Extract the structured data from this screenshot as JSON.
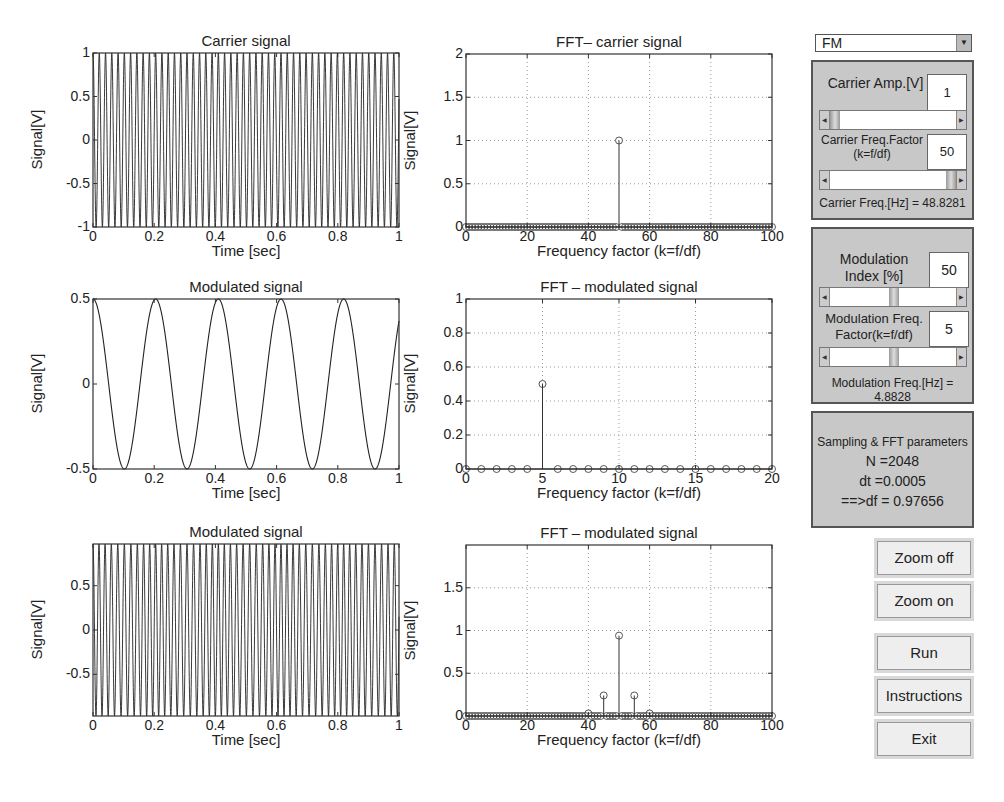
{
  "controls": {
    "modulation_type": {
      "selected": "FM"
    },
    "carrier_panel": {
      "amp_label": "Carrier Amp.[V]",
      "amp_value": "1",
      "freq_factor_label_1": "Carrier Freq.Factor",
      "freq_factor_label_2": "(k=f/df)",
      "freq_factor_value": "50",
      "freq_readout": "Carrier Freq.[Hz] = 48.8281"
    },
    "modulation_panel": {
      "index_label_1": "Modulation",
      "index_label_2": "Index [%]",
      "index_value": "50",
      "freq_factor_label_1": "Modulation Freq.",
      "freq_factor_label_2": "Factor(k=f/df)",
      "freq_factor_value": "5",
      "freq_readout": "Modulation Freq.[Hz] = 4.8828"
    },
    "sampling_panel": {
      "title": "Sampling & FFT parameters",
      "n_line": "N =2048",
      "dt_line": "dt =0.0005",
      "df_line": "==>df = 0.97656"
    },
    "buttons": {
      "zoom_off": "Zoom off",
      "zoom_on": "Zoom on",
      "run": "Run",
      "instructions": "Instructions",
      "exit": "Exit"
    }
  },
  "chart_data": [
    {
      "id": "carrier",
      "type": "line",
      "title": "Carrier signal",
      "xlabel": "Time [sec]",
      "ylabel": "Signal[V]",
      "xlim": [
        0,
        1
      ],
      "ylim": [
        -1,
        1
      ],
      "xticks": [
        "0",
        "0.2",
        "0.4",
        "0.6",
        "0.8",
        "1"
      ],
      "yticks": [
        "-1",
        "-0.5",
        "0",
        "0.5",
        "1"
      ],
      "grid": false,
      "series": [
        {
          "name": "carrier",
          "function": "1*cos(2*pi*48.8281*t)",
          "amplitude": 1,
          "frequency_hz": 48.8281
        }
      ]
    },
    {
      "id": "fft_carrier",
      "type": "stem",
      "title": "FFT– carrier signal",
      "xlabel": "Frequency factor (k=f/df)",
      "ylabel": "Signal[V]",
      "xlim": [
        0,
        100
      ],
      "ylim": [
        0,
        2
      ],
      "xticks": [
        "0",
        "20",
        "40",
        "60",
        "80",
        "100"
      ],
      "yticks": [
        "0",
        "0.5",
        "1",
        "1.5",
        "2"
      ],
      "grid": true,
      "k_range": [
        0,
        100
      ],
      "peaks": [
        {
          "k": 50,
          "value": 1.0
        }
      ]
    },
    {
      "id": "modulating",
      "type": "line",
      "title": "Modulated signal",
      "xlabel": "Time [sec]",
      "ylabel": "Signal[V]",
      "xlim": [
        0,
        1
      ],
      "ylim": [
        -0.5,
        0.5
      ],
      "xticks": [
        "0",
        "0.2",
        "0.4",
        "0.6",
        "0.8",
        "1"
      ],
      "yticks": [
        "-0.5",
        "0",
        "0.5"
      ],
      "grid": false,
      "series": [
        {
          "name": "modulating",
          "function": "0.5*cos(2*pi*4.8828*t)",
          "amplitude": 0.5,
          "frequency_hz": 4.8828
        }
      ]
    },
    {
      "id": "fft_modulating",
      "type": "stem",
      "title": "FFT – modulated signal",
      "xlabel": "Frequency factor (k=f/df)",
      "ylabel": "Signal[V]",
      "xlim": [
        0,
        20
      ],
      "ylim": [
        0,
        1
      ],
      "xticks": [
        "0",
        "5",
        "10",
        "15",
        "20"
      ],
      "yticks": [
        "0",
        "0.2",
        "0.4",
        "0.6",
        "0.8",
        "1"
      ],
      "grid": true,
      "k_range": [
        0,
        20
      ],
      "peaks": [
        {
          "k": 5,
          "value": 0.5
        }
      ]
    },
    {
      "id": "fm_signal",
      "type": "line",
      "title": "Modulated signal",
      "xlabel": "Time [sec]",
      "ylabel": "Signal[V]",
      "xlim": [
        0,
        1
      ],
      "ylim": [
        -0.97,
        0.97
      ],
      "xticks": [
        "0",
        "0.2",
        "0.4",
        "0.6",
        "0.8",
        "1"
      ],
      "yticks": [
        "-0.5",
        "0",
        "0.5"
      ],
      "grid": false,
      "series": [
        {
          "name": "fm",
          "function": "cos(2*pi*48.8281*t + 0.5*sin(2*pi*4.8828*t))",
          "amplitude": 1,
          "frequency_hz": 48.8281
        }
      ]
    },
    {
      "id": "fft_fm",
      "type": "stem",
      "title": "FFT – modulated signal",
      "xlabel": "Frequency factor (k=f/df)",
      "ylabel": "Signal[V]",
      "xlim": [
        0,
        100
      ],
      "ylim": [
        0,
        2
      ],
      "xticks": [
        "0",
        "20",
        "40",
        "60",
        "80",
        "100"
      ],
      "yticks": [
        "0",
        "0.5",
        "1",
        "1.5"
      ],
      "grid": true,
      "k_range": [
        0,
        100
      ],
      "peaks": [
        {
          "k": 40,
          "value": 0.03
        },
        {
          "k": 45,
          "value": 0.24
        },
        {
          "k": 50,
          "value": 0.94
        },
        {
          "k": 55,
          "value": 0.24
        },
        {
          "k": 60,
          "value": 0.03
        }
      ]
    }
  ],
  "layout": {
    "plots": [
      {
        "left": 93,
        "top": 53,
        "width": 306,
        "height": 174
      },
      {
        "left": 466,
        "top": 54,
        "width": 306,
        "height": 173
      },
      {
        "left": 93,
        "top": 299,
        "width": 306,
        "height": 170
      },
      {
        "left": 466,
        "top": 299,
        "width": 306,
        "height": 170
      },
      {
        "left": 93,
        "top": 544,
        "width": 306,
        "height": 172
      },
      {
        "left": 466,
        "top": 545,
        "width": 306,
        "height": 171
      }
    ]
  }
}
